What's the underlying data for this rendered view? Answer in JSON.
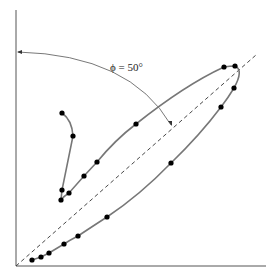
{
  "diagram": {
    "type": "phase-lag-ellipse",
    "annotation": {
      "text": "ϕ = 50°",
      "angle_deg": 50
    },
    "colors": {
      "axes": "#555555",
      "curve": "#777777",
      "points": "#000000",
      "diagonal": "#333333",
      "arc": "#555555"
    },
    "axes": {
      "origin": [
        16,
        266
      ],
      "x_end": [
        266,
        266
      ],
      "y_end": [
        16,
        10
      ]
    },
    "diagonal": {
      "from": [
        16,
        266
      ],
      "to": [
        256,
        55
      ]
    },
    "arc": {
      "from": [
        171,
        125
      ],
      "to": [
        18,
        52
      ]
    },
    "curve_points": [
      [
        62,
        113
      ],
      [
        73,
        136
      ],
      [
        62,
        190
      ],
      [
        61,
        200
      ],
      [
        69,
        193
      ],
      [
        84,
        176
      ],
      [
        97,
        162
      ],
      [
        136,
        124
      ],
      [
        224,
        67
      ],
      [
        235,
        66
      ],
      [
        234,
        88
      ],
      [
        221,
        107
      ],
      [
        171,
        163
      ],
      [
        107,
        217
      ],
      [
        78,
        236
      ],
      [
        64,
        244
      ],
      [
        49,
        253
      ],
      [
        41,
        257
      ],
      [
        32,
        260
      ]
    ]
  }
}
